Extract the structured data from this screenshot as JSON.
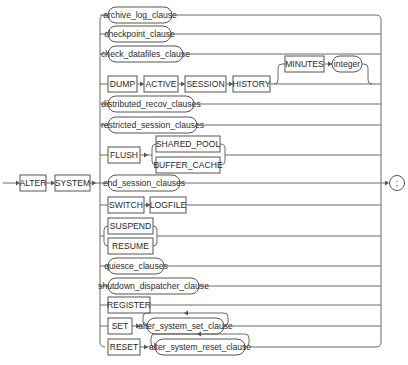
{
  "diagram": {
    "title": "alter_system",
    "start": {
      "keywords": [
        "ALTER",
        "SYSTEM"
      ]
    },
    "terminator": ";",
    "branches": [
      {
        "type": "nonterminal",
        "label": "archive_log_clause"
      },
      {
        "type": "nonterminal",
        "label": "checkpoint_clause"
      },
      {
        "type": "nonterminal",
        "label": "check_datafiles_clause"
      },
      {
        "type": "sequence",
        "items": [
          "DUMP",
          "ACTIVE",
          "SESSION",
          "HISTORY"
        ],
        "optional": {
          "items": [
            "MINUTES",
            "integer"
          ]
        }
      },
      {
        "type": "nonterminal",
        "label": "distributed_recov_clauses"
      },
      {
        "type": "nonterminal",
        "label": "restricted_session_clauses"
      },
      {
        "type": "sequence",
        "items": [
          "FLUSH"
        ],
        "choice": [
          "SHARED_POOL",
          "BUFFER_CACHE"
        ]
      },
      {
        "type": "nonterminal",
        "label": "end_session_clauses"
      },
      {
        "type": "sequence",
        "items": [
          "SWITCH",
          "LOGFILE"
        ]
      },
      {
        "type": "choice",
        "items": [
          "SUSPEND",
          "RESUME"
        ]
      },
      {
        "type": "nonterminal",
        "label": "quiesce_clauses"
      },
      {
        "type": "nonterminal",
        "label": "shutdown_dispatcher_clause"
      },
      {
        "type": "keyword",
        "label": "REGISTER"
      },
      {
        "type": "sequence",
        "items": [
          "SET"
        ],
        "repeat": "alter_system_set_clause"
      },
      {
        "type": "sequence",
        "items": [
          "RESET"
        ],
        "repeat": "alter_system_reset_clause"
      }
    ]
  },
  "labels": {
    "alter": "ALTER",
    "system": "SYSTEM",
    "archive_log_clause": "archive_log_clause",
    "checkpoint_clause": "checkpoint_clause",
    "check_datafiles_clause": "check_datafiles_clause",
    "dump": "DUMP",
    "active": "ACTIVE",
    "session": "SESSION",
    "history": "HISTORY",
    "minutes": "MINUTES",
    "integer": "integer",
    "distributed_recov_clauses": "distributed_recov_clauses",
    "restricted_session_clauses": "restricted_session_clauses",
    "flush": "FLUSH",
    "shared_pool": "SHARED_POOL",
    "buffer_cache": "BUFFER_CACHE",
    "end_session_clauses": "end_session_clauses",
    "switch": "SWITCH",
    "logfile": "LOGFILE",
    "suspend": "SUSPEND",
    "resume": "RESUME",
    "quiesce_clauses": "quiesce_clauses",
    "shutdown_dispatcher_clause": "shutdown_dispatcher_clause",
    "register": "REGISTER",
    "set": "SET",
    "alter_system_set_clause": "alter_system_set_clause",
    "reset": "RESET",
    "alter_system_reset_clause": "alter_system_reset_clause",
    "semicolon": ";"
  }
}
